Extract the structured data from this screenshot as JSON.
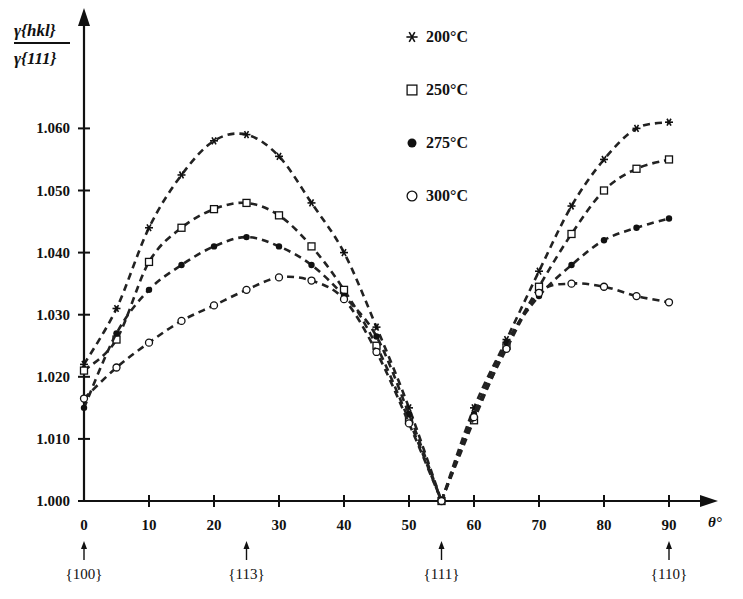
{
  "chart_data": {
    "type": "line",
    "title": "",
    "ylabel_num": "γ{hkl}",
    "ylabel_den": "γ{111}",
    "xlabel": "θ°",
    "xlim": [
      0,
      90
    ],
    "ylim": [
      1.0,
      1.06
    ],
    "grid": false,
    "legend_position": "top-center",
    "xticks": [
      0,
      10,
      20,
      30,
      40,
      50,
      60,
      70,
      80,
      90
    ],
    "xtick_labels": [
      "0",
      "10",
      "20",
      "30",
      "40",
      "50",
      "60",
      "70",
      "80",
      "90"
    ],
    "yticks": [
      1.0,
      1.01,
      1.02,
      1.03,
      1.04,
      1.05,
      1.06
    ],
    "ytick_labels": [
      "1.000",
      "1.010",
      "1.020",
      "1.030",
      "1.040",
      "1.050",
      "1.060"
    ],
    "annotations": [
      {
        "x": 0,
        "label": "{100}"
      },
      {
        "x": 25,
        "label": "{113}"
      },
      {
        "x": 55,
        "label": "{111}"
      },
      {
        "x": 90,
        "label": "{110}"
      }
    ],
    "x": [
      0,
      5,
      10,
      15,
      20,
      25,
      30,
      35,
      40,
      45,
      50,
      55,
      60,
      65,
      70,
      75,
      80,
      85,
      90
    ],
    "series": [
      {
        "name": "200°C",
        "marker": "asterisk",
        "values": [
          1.022,
          1.031,
          1.044,
          1.0525,
          1.058,
          1.059,
          1.0555,
          1.048,
          1.04,
          1.028,
          1.015,
          1.0,
          1.015,
          1.026,
          1.037,
          1.0475,
          1.055,
          1.06,
          1.061
        ]
      },
      {
        "name": "250°C",
        "marker": "open-square",
        "values": [
          1.021,
          1.026,
          1.0385,
          1.044,
          1.047,
          1.048,
          1.046,
          1.041,
          1.034,
          1.025,
          1.013,
          1.0,
          1.013,
          1.025,
          1.0345,
          1.043,
          1.05,
          1.0535,
          1.055
        ]
      },
      {
        "name": "275°C",
        "marker": "filled-circle",
        "values": [
          1.015,
          1.027,
          1.034,
          1.038,
          1.041,
          1.0425,
          1.041,
          1.038,
          1.033,
          1.0265,
          1.014,
          1.0,
          1.014,
          1.0255,
          1.033,
          1.038,
          1.042,
          1.044,
          1.0455
        ]
      },
      {
        "name": "300°C",
        "marker": "open-circle",
        "values": [
          1.0165,
          1.0215,
          1.0255,
          1.029,
          1.0315,
          1.034,
          1.036,
          1.0355,
          1.0325,
          1.024,
          1.0125,
          1.0,
          1.0135,
          1.0245,
          1.0335,
          1.035,
          1.0345,
          1.033,
          1.032
        ]
      }
    ]
  }
}
